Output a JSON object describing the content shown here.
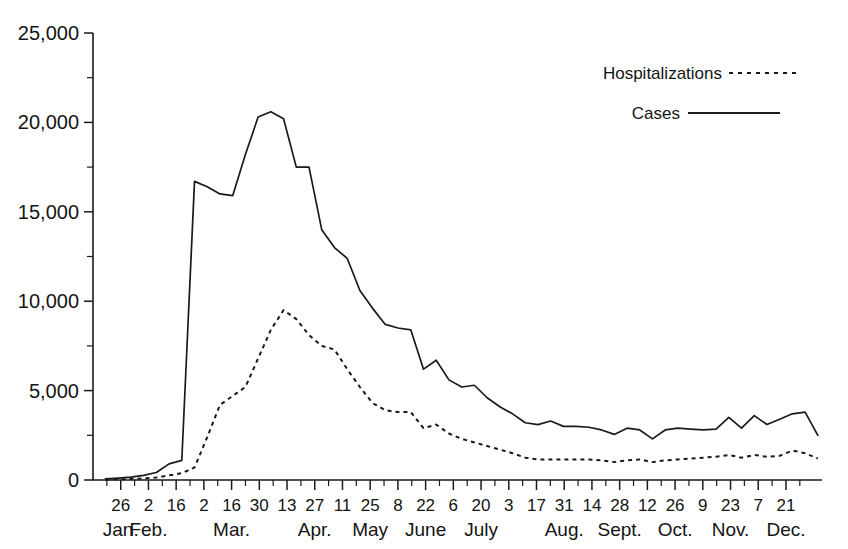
{
  "chart_data": {
    "type": "line",
    "title": "",
    "subtitle": "",
    "xlabel": "",
    "ylabel": "",
    "ylim": [
      0,
      25000
    ],
    "grid": false,
    "legend_position": "top-right",
    "y_ticks": [
      "0",
      "5,000",
      "10,000",
      "15,000",
      "20,000",
      "25,000"
    ],
    "y_tick_values": [
      0,
      5000,
      10000,
      15000,
      20000,
      25000
    ],
    "y_minor_tick_values": [
      2500,
      7500,
      12500,
      17500,
      22500
    ],
    "x_tick_labels": [
      "26",
      "2",
      "16",
      "2",
      "16",
      "30",
      "13",
      "27",
      "11",
      "25",
      "8",
      "22",
      "6",
      "20",
      "3",
      "17",
      "31",
      "14",
      "28",
      "12",
      "26",
      "9",
      "23",
      "7",
      "21"
    ],
    "x_month_labels": [
      {
        "label": "Jan.",
        "at_index": 0
      },
      {
        "label": "Feb.",
        "at_index": 1
      },
      {
        "label": "Mar.",
        "at_index": 4
      },
      {
        "label": "Apr.",
        "at_index": 7
      },
      {
        "label": "May",
        "at_index": 9
      },
      {
        "label": "June",
        "at_index": 11
      },
      {
        "label": "July",
        "at_index": 13
      },
      {
        "label": "Aug.",
        "at_index": 16
      },
      {
        "label": "Sept.",
        "at_index": 18
      },
      {
        "label": "Oct.",
        "at_index": 20
      },
      {
        "label": "Nov.",
        "at_index": 22
      },
      {
        "label": "Dec.",
        "at_index": 24
      }
    ],
    "series": [
      {
        "name": "Cases",
        "style": "solid",
        "color": "#1a1a1a",
        "values": [
          60,
          110,
          160,
          260,
          420,
          900,
          1100,
          16700,
          16400,
          16000,
          15900,
          18200,
          20300,
          20600,
          20200,
          17500,
          17500,
          14000,
          13000,
          12400,
          10600,
          9600,
          8700,
          8500,
          8400,
          6200,
          6700,
          5600,
          5200,
          5300,
          4600,
          4100,
          3700,
          3200,
          3100,
          3300,
          3000,
          3000,
          2950,
          2800,
          2550,
          2900,
          2800,
          2300,
          2800,
          2900,
          2850,
          2800,
          2850,
          3500,
          2900,
          3600,
          3100,
          3400,
          3700,
          3800,
          2500
        ]
      },
      {
        "name": "Hospitalizations",
        "style": "dashed",
        "color": "#1a1a1a",
        "values": [
          20,
          40,
          60,
          90,
          140,
          260,
          380,
          700,
          2400,
          4200,
          4700,
          5200,
          6800,
          8400,
          9500,
          9000,
          8100,
          7500,
          7300,
          6200,
          5200,
          4300,
          3900,
          3800,
          3800,
          2900,
          3100,
          2600,
          2300,
          2100,
          1900,
          1700,
          1500,
          1250,
          1150,
          1150,
          1150,
          1150,
          1150,
          1100,
          1000,
          1100,
          1150,
          1000,
          1100,
          1150,
          1200,
          1250,
          1300,
          1400,
          1250,
          1400,
          1300,
          1350,
          1650,
          1500,
          1200
        ]
      }
    ],
    "legend": [
      {
        "label": "Hospitalizations",
        "style": "dashed"
      },
      {
        "label": "Cases",
        "style": "solid"
      }
    ]
  }
}
